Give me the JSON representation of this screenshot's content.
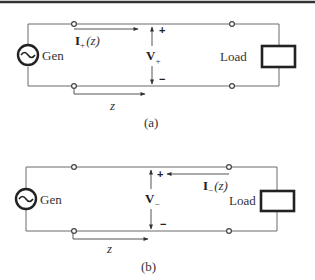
{
  "diagrams": [
    {
      "caption": "(a)",
      "generator_label": "Gen",
      "load_label": "Load",
      "current_label": {
        "symbol": "I",
        "subscript": "+",
        "argument": "(z)"
      },
      "voltage_label": {
        "symbol": "V",
        "subscript": "+"
      },
      "voltage_polarity": {
        "top": "+",
        "bottom": "−"
      },
      "position_label": "z",
      "current_direction": "toward-load"
    },
    {
      "caption": "(b)",
      "generator_label": "Gen",
      "load_label": "Load",
      "current_label": {
        "symbol": "I",
        "subscript": "−",
        "argument": "(z)"
      },
      "voltage_label": {
        "symbol": "V",
        "subscript": "−"
      },
      "voltage_polarity": {
        "top": "+",
        "bottom": "−"
      },
      "position_label": "z",
      "current_direction": "toward-generator"
    }
  ],
  "colors": {
    "wire": "#6a6a6a",
    "stroke": "#222222",
    "background": "#ffffff"
  }
}
